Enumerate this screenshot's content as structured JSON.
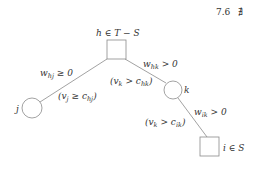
{
  "header": {
    "section_number": "7.6",
    "section_symbol": "∄"
  },
  "diagram": {
    "nodes": {
      "h": {
        "shape": "square",
        "label": "h ∈ T − S"
      },
      "j": {
        "shape": "circle",
        "label": "j"
      },
      "k": {
        "shape": "circle",
        "label": "k"
      },
      "i": {
        "shape": "square",
        "label": "i ∈ S"
      }
    },
    "edges": {
      "h_j": {
        "weight_base": "w",
        "weight_sub": "hj",
        "weight_rel": " ≥ 0",
        "cond_open": "(v",
        "cond_var_sub": "j",
        "cond_rel": " ≥ c",
        "cond_c_sub": "hj",
        "cond_close": ")"
      },
      "h_k": {
        "weight_base": "w",
        "weight_sub": "hk",
        "weight_rel": " > 0",
        "cond_open": "(v",
        "cond_var_sub": "k",
        "cond_rel": " > c",
        "cond_c_sub": "hk",
        "cond_close": ")"
      },
      "k_i": {
        "weight_base": "w",
        "weight_sub": "ik",
        "weight_rel": " > 0",
        "cond_open": "(v",
        "cond_var_sub": "k",
        "cond_rel": " > c",
        "cond_c_sub": "ik",
        "cond_close": ")"
      }
    },
    "colors": {
      "stroke": "#888888",
      "text": "#333333",
      "background": "#ffffff"
    }
  }
}
